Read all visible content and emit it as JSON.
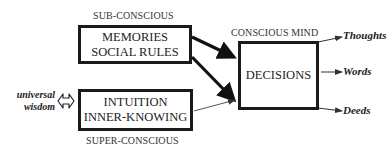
{
  "diagram": {
    "subconscious": {
      "label": "SUB-CONSCIOUS",
      "box_lines": [
        "MEMORIES",
        "SOCIAL RULES"
      ]
    },
    "superconscious": {
      "label": "SUPER-CONSCIOUS",
      "box_lines": [
        "INTUITION",
        "INNER-KNOWING"
      ]
    },
    "conscious": {
      "label": "CONSCIOUS MIND",
      "box_label": "DECISIONS"
    },
    "source": {
      "lines": [
        "universal",
        "wisdom"
      ],
      "connector": "bidirectional-arrow"
    },
    "outputs": [
      "Thoughts",
      "Words",
      "Deeds"
    ],
    "edges": [
      {
        "from": "MEMORIES / SOCIAL RULES",
        "to": "DECISIONS",
        "style": "thick"
      },
      {
        "from": "MEMORIES / SOCIAL RULES",
        "to": "DECISIONS",
        "style": "thick"
      },
      {
        "from": "INTUITION / INNER-KNOWING",
        "to": "DECISIONS",
        "style": "thin"
      },
      {
        "from": "universal wisdom",
        "to": "INTUITION / INNER-KNOWING",
        "style": "bidirectional"
      },
      {
        "from": "DECISIONS",
        "to": "Thoughts",
        "style": "thin"
      },
      {
        "from": "DECISIONS",
        "to": "Words",
        "style": "thin"
      },
      {
        "from": "DECISIONS",
        "to": "Deeds",
        "style": "thin"
      }
    ]
  }
}
